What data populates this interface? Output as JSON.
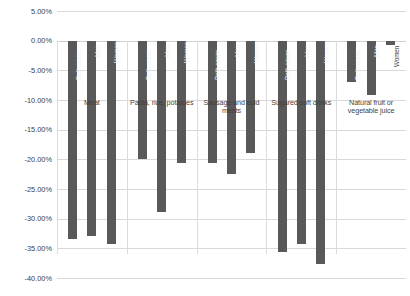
{
  "chart_data": {
    "type": "bar",
    "title": "",
    "subtitle": "",
    "xlabel": "",
    "ylabel": "",
    "ylim": [
      -40,
      5
    ],
    "ytick_labels": [
      "5.00%",
      "0.00%",
      "-5.00%",
      "-10.00%",
      "-15.00%",
      "-20.00%",
      "-25.00%",
      "-30.00%",
      "-35.00%",
      "-40.00%"
    ],
    "ytick_values": [
      5,
      0,
      -5,
      -10,
      -15,
      -20,
      -25,
      -30,
      -35,
      -40
    ],
    "grid": true,
    "legend": "none",
    "legend_position": "none",
    "orientation": "vertical",
    "bar_color": "#595959",
    "categories": [
      "Meat",
      "Pasta, rice, potatoes",
      "Sausage and cold meats",
      "Sugared soft drinks",
      "Natural fruit or vegetable juice"
    ],
    "series": [
      {
        "name": "Both sexes",
        "values": [
          -33.5,
          -20.0,
          -20.7,
          -35.7,
          -7.0
        ]
      },
      {
        "name": "Men",
        "values": [
          -33.0,
          -28.8,
          -22.5,
          -34.2,
          -9.2
        ]
      },
      {
        "name": "Women",
        "values": [
          -34.2,
          -20.7,
          -19.0,
          -37.7,
          -0.7
        ]
      }
    ],
    "bars": [
      {
        "category": "Meat",
        "series": "Both sexes",
        "value": -33.5
      },
      {
        "category": "Meat",
        "series": "Men",
        "value": -33.0
      },
      {
        "category": "Meat",
        "series": "Women",
        "value": -34.2
      },
      {
        "category": "Pasta, rice, potatoes",
        "series": "Both sexes",
        "value": -20.0
      },
      {
        "category": "Pasta, rice, potatoes",
        "series": "Men",
        "value": -28.8
      },
      {
        "category": "Pasta, rice, potatoes",
        "series": "Women",
        "value": -20.7
      },
      {
        "category": "Sausage and cold meats",
        "series": "Both sexes",
        "value": -20.7
      },
      {
        "category": "Sausage and cold meats",
        "series": "Men",
        "value": -22.5
      },
      {
        "category": "Sausage and cold meats",
        "series": "Women",
        "value": -19.0
      },
      {
        "category": "Sugared soft drinks",
        "series": "Both sexes",
        "value": -35.7
      },
      {
        "category": "Sugared soft drinks",
        "series": "Men",
        "value": -34.2
      },
      {
        "category": "Sugared soft drinks",
        "series": "Women",
        "value": -37.7
      },
      {
        "category": "Natural fruit or vegetable juice",
        "series": "Both sexes",
        "value": -7.0
      },
      {
        "category": "Natural fruit or vegetable juice",
        "series": "Men",
        "value": -9.2
      },
      {
        "category": "Natural fruit or vegetable juice",
        "series": "Women",
        "value": -0.7
      }
    ]
  }
}
